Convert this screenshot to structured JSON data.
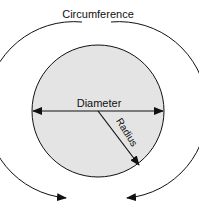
{
  "diagram": {
    "title_label": "Circumference",
    "diameter_label": "Diameter",
    "radius_label": "Radius",
    "colors": {
      "circle_fill": "#e4e4e4",
      "stroke": "#111111",
      "background": "#ffffff"
    }
  }
}
